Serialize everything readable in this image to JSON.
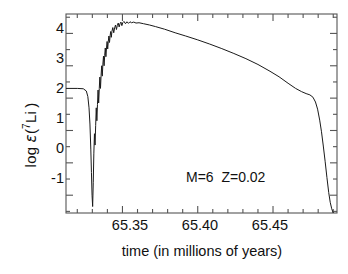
{
  "figure": {
    "background": "#ffffff",
    "line_color": "#1a1a1a",
    "axis_color": "#4d4d4d",
    "text_color": "#111111"
  },
  "chart_data": {
    "type": "line",
    "title": "",
    "xlabel": "time (in millions of years)",
    "ylabel": "log ε(⁷Li)",
    "ylabel_parts": {
      "prefix": "log ",
      "epsilon": "ε",
      "open": "(",
      "superscript": "7",
      "element": "Li",
      "close": ")"
    },
    "xlim": [
      65.3125,
      65.4925
    ],
    "ylim": [
      -1.55,
      4.6
    ],
    "grid": false,
    "legend": false,
    "xticks_major": [
      65.35,
      65.4,
      65.45
    ],
    "xtick_labels": [
      "65.35",
      "65.40",
      "65.45"
    ],
    "xticks_minor": [
      65.32,
      65.33,
      65.34,
      65.36,
      65.37,
      65.38,
      65.39,
      65.41,
      65.42,
      65.43,
      65.44,
      65.46,
      65.47,
      65.48,
      65.49
    ],
    "yticks": [
      -1,
      0,
      1,
      2,
      3,
      4
    ],
    "ytick_labels": [
      "-1",
      "0",
      "1",
      "2",
      "3",
      "4"
    ],
    "annotations": [
      {
        "text": "M=6  Z=0.02",
        "x": 65.4,
        "y": 0.6
      }
    ],
    "series": [
      {
        "name": "log eps(7Li)",
        "color": "#1a1a1a",
        "description": "Surface lithium abundance during hot bottom burning: flat plateau at 2.3, deep minimum at -1.35, sawtooth rise to peak 4.35, slow decline, final steep drop.",
        "x": [
          65.3125,
          65.32,
          65.324,
          65.326,
          65.327,
          65.3278,
          65.3284,
          65.329,
          65.3294,
          65.3298,
          65.3302,
          65.3306,
          65.331,
          65.3314,
          65.3318,
          65.3322,
          65.3326,
          65.333,
          65.3334,
          65.3338,
          65.3342,
          65.3346,
          65.335,
          65.3354,
          65.3358,
          65.3362,
          65.3366,
          65.337,
          65.3374,
          65.3378,
          65.3382,
          65.3386,
          65.339,
          65.3394,
          65.3398,
          65.3402,
          65.3406,
          65.341,
          65.3414,
          65.3418,
          65.3422,
          65.3426,
          65.343,
          65.3436,
          65.3442,
          65.3448,
          65.3454,
          65.346,
          65.3466,
          65.3472,
          65.3478,
          65.3484,
          65.349,
          65.3496,
          65.3502,
          65.351,
          65.352,
          65.353,
          65.354,
          65.355,
          65.356,
          65.3575,
          65.359,
          65.361,
          65.364,
          65.368,
          65.372,
          65.378,
          65.385,
          65.392,
          65.4,
          65.408,
          65.416,
          65.424,
          65.432,
          65.44,
          65.448,
          65.454,
          65.46,
          65.465,
          65.469,
          65.472,
          65.4745,
          65.4765,
          65.4782,
          65.4796,
          65.481,
          65.4822,
          65.4834,
          65.4846,
          65.4858,
          65.487,
          65.488,
          65.489,
          65.49
        ],
        "y": [
          2.3,
          2.3,
          2.29,
          2.22,
          2.05,
          1.7,
          1.2,
          0.4,
          -0.3,
          -1.0,
          -1.35,
          -0.6,
          0.3,
          0.9,
          0.55,
          1.15,
          1.7,
          1.3,
          1.8,
          2.25,
          1.85,
          2.3,
          2.65,
          2.3,
          2.7,
          3.0,
          2.68,
          3.05,
          3.3,
          3.0,
          3.32,
          3.55,
          3.28,
          3.55,
          3.75,
          3.52,
          3.76,
          3.92,
          3.72,
          3.93,
          4.06,
          3.88,
          4.06,
          4.18,
          4.02,
          4.17,
          4.26,
          4.12,
          4.25,
          4.32,
          4.2,
          4.3,
          4.35,
          4.24,
          4.33,
          4.37,
          4.3,
          4.36,
          4.31,
          4.36,
          4.33,
          4.35,
          4.32,
          4.33,
          4.3,
          4.26,
          4.21,
          4.13,
          4.02,
          3.92,
          3.8,
          3.67,
          3.53,
          3.38,
          3.22,
          3.04,
          2.83,
          2.66,
          2.46,
          2.3,
          2.2,
          2.14,
          2.1,
          2.03,
          1.88,
          1.66,
          1.32,
          0.96,
          0.52,
          0.05,
          -0.45,
          -0.92,
          -1.22,
          -1.42,
          -1.55
        ]
      }
    ]
  }
}
